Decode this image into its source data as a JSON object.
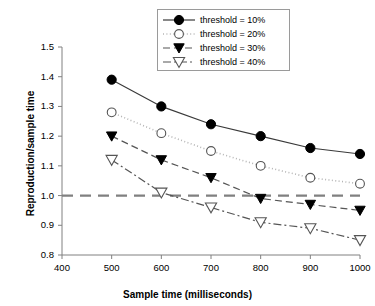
{
  "chart_data": {
    "type": "line",
    "title": "",
    "xlabel": "Sample time (milliseconds)",
    "ylabel": "Reproduction/sample time",
    "x": [
      500,
      600,
      700,
      800,
      900,
      1000
    ],
    "xlim": [
      400,
      1000
    ],
    "ylim": [
      0.8,
      1.5
    ],
    "xticks": [
      "400",
      "500",
      "600",
      "700",
      "800",
      "900",
      "1000"
    ],
    "yticks": [
      "0.8",
      "0.9",
      "1.0",
      "1.1",
      "1.2",
      "1.3",
      "1.4",
      "1.5"
    ],
    "grid": false,
    "legend_position": "top-center",
    "reference_line": {
      "y": 1.0,
      "style": "dashed",
      "color": "#808080"
    },
    "series": [
      {
        "name": "threshold = 10%",
        "marker": "filled-circle",
        "line_style": "solid",
        "color": "#000000",
        "values": [
          1.39,
          1.3,
          1.24,
          1.2,
          1.16,
          1.14
        ]
      },
      {
        "name": "threshold = 20%",
        "marker": "open-circle",
        "line_style": "dotted",
        "color": "#000000",
        "values": [
          1.28,
          1.21,
          1.15,
          1.1,
          1.06,
          1.04
        ]
      },
      {
        "name": "threshold = 30%",
        "marker": "filled-triangle-down",
        "line_style": "dashed",
        "color": "#000000",
        "values": [
          1.2,
          1.12,
          1.06,
          0.99,
          0.97,
          0.95
        ]
      },
      {
        "name": "threshold = 40%",
        "marker": "open-triangle-down",
        "line_style": "dash-dot",
        "color": "#000000",
        "values": [
          1.12,
          1.01,
          0.96,
          0.91,
          0.89,
          0.85
        ]
      }
    ]
  },
  "legend": {
    "items": [
      {
        "label": "threshold = 10%"
      },
      {
        "label": "threshold = 20%"
      },
      {
        "label": "threshold = 30%"
      },
      {
        "label": "threshold = 40%"
      }
    ]
  }
}
